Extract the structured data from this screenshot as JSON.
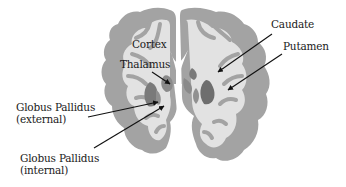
{
  "diagram": {
    "colors": {
      "background": "#ffffff",
      "gray_matter": "#a3a3a3",
      "white_matter": "#e2e2e2",
      "deep_nuclei": "#7a7a7a",
      "label_text": "#1a1a1a",
      "arrow": "#111111"
    },
    "labels": {
      "cortex": "Cortex",
      "thalamus": "Thalamus",
      "caudate": "Caudate",
      "putamen": "Putamen",
      "gp_external_line1": "Globus Pallidus",
      "gp_external_line2": "(external)",
      "gp_internal_line1": "Globus Pallidus",
      "gp_internal_line2": "(internal)"
    }
  }
}
